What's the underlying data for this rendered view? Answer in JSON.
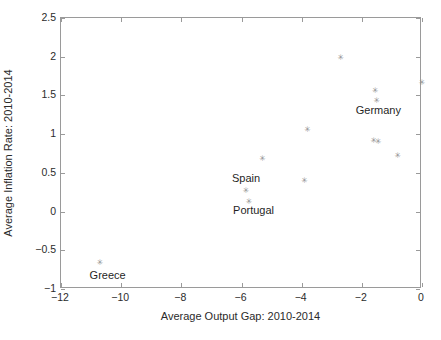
{
  "chart_data": {
    "type": "scatter",
    "title": "",
    "xlabel": "Average Output Gap: 2010-2014",
    "ylabel": "Average Inflation Rate: 2010-2014",
    "xlim": [
      -12,
      0
    ],
    "ylim": [
      -1,
      2.5
    ],
    "xticks": [
      -12,
      -10,
      -8,
      -6,
      -4,
      -2,
      0
    ],
    "xticklabels": [
      "−12",
      "−10",
      "−8",
      "−6",
      "−4",
      "−2",
      "0"
    ],
    "yticks": [
      -1,
      -0.5,
      0,
      0.5,
      1,
      1.5,
      2,
      2.5
    ],
    "yticklabels": [
      "−1",
      "−0.5",
      "0",
      "0.5",
      "1",
      "1.5",
      "2",
      "2.5"
    ],
    "grid": false,
    "legend": null,
    "marker": "asterisk",
    "marker_color": "#8d8d8d",
    "points": [
      {
        "x": -10.7,
        "y": -0.66,
        "label": "Greece"
      },
      {
        "x": -5.85,
        "y": 0.27,
        "label": "Spain"
      },
      {
        "x": -5.75,
        "y": 0.13,
        "label": "Portugal"
      },
      {
        "x": -5.3,
        "y": 0.69,
        "label": ""
      },
      {
        "x": -3.9,
        "y": 0.4,
        "label": ""
      },
      {
        "x": -3.8,
        "y": 1.06,
        "label": ""
      },
      {
        "x": -2.7,
        "y": 1.99,
        "label": ""
      },
      {
        "x": -1.55,
        "y": 1.57,
        "label": ""
      },
      {
        "x": -1.6,
        "y": 0.92,
        "label": ""
      },
      {
        "x": -1.45,
        "y": 0.9,
        "label": ""
      },
      {
        "x": -1.5,
        "y": 1.44,
        "label": "Germany"
      },
      {
        "x": -0.8,
        "y": 0.73,
        "label": ""
      },
      {
        "x": 0.0,
        "y": 1.67,
        "label": ""
      }
    ],
    "annotations": [
      {
        "text": "Greece",
        "x": -10.45,
        "y": -0.82
      },
      {
        "text": "Spain",
        "x": -5.85,
        "y": 0.43
      },
      {
        "text": "Portugal",
        "x": -5.6,
        "y": 0.02
      },
      {
        "text": "Germany",
        "x": -1.45,
        "y": 1.31
      }
    ]
  }
}
